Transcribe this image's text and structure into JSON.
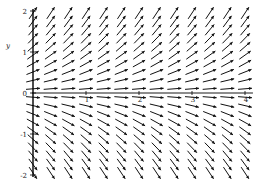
{
  "chart_data": {
    "type": "direction_field",
    "title": "",
    "equation_implied": "dy/dx = y",
    "xlabel": "",
    "ylabel": "y",
    "xlim": [
      0,
      4.15
    ],
    "ylim": [
      -2.05,
      2.05
    ],
    "x_ticks": [
      1,
      2,
      3,
      4
    ],
    "x_tick_labels": [
      "1",
      "2",
      "3",
      "4"
    ],
    "y_ticks": [
      -2,
      -1,
      0,
      1,
      2
    ],
    "y_tick_labels": [
      "-2",
      "-1",
      "0",
      "1",
      "2"
    ],
    "grid": false,
    "legend": null,
    "field_grid": {
      "nx": 13,
      "ny": 20,
      "x_start": 0,
      "x_end": 4,
      "y_start": -1.95,
      "y_end": 1.95
    },
    "arrow_color": "#111111",
    "axis_color": "#000000"
  }
}
